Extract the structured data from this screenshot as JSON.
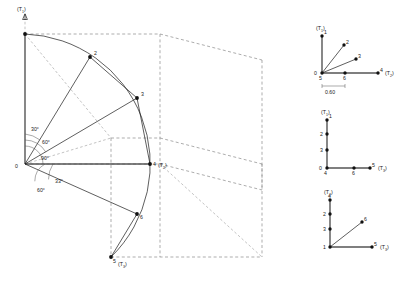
{
  "figure": {
    "main": {
      "name": "main-spherical-diagram",
      "vertical_axis_label": "(T",
      "vertical_axis_sub": "1",
      "vertical_axis_close": ")",
      "origin_label": "0",
      "angles": [
        {
          "id": "a30",
          "text": "30°"
        },
        {
          "id": "a60",
          "text": "60°"
        },
        {
          "id": "a90",
          "text": "90°"
        },
        {
          "id": "a33",
          "text": "33°"
        },
        {
          "id": "a60b",
          "text": "60°"
        }
      ],
      "points": [
        {
          "id": "p1",
          "label": "1"
        },
        {
          "id": "p2",
          "label": "2"
        },
        {
          "id": "p3",
          "label": "3"
        },
        {
          "id": "p4",
          "label": "4"
        },
        {
          "id": "p5",
          "label": "5"
        },
        {
          "id": "p6",
          "label": "6"
        }
      ],
      "axis_t2_label": "(T",
      "axis_t2_sub": "2",
      "axis_t2_close": ")",
      "axis_t3_label": "(T",
      "axis_t3_sub": "3",
      "axis_t3_close": ")"
    },
    "inset_top": {
      "name": "inset-t1-t2",
      "vaxis": "(T",
      "vaxis_sub": "1",
      "vaxis_close": ")",
      "haxis": "(T",
      "haxis_sub": "2",
      "haxis_close": ")",
      "origin_label": "0",
      "dimension": "0.60",
      "points": [
        {
          "id": "t1",
          "label": "1"
        },
        {
          "id": "t2",
          "label": "2"
        },
        {
          "id": "t3",
          "label": "3"
        },
        {
          "id": "t4",
          "label": "4"
        },
        {
          "id": "t5",
          "label": "5"
        },
        {
          "id": "t6",
          "label": "6"
        }
      ]
    },
    "inset_mid": {
      "name": "inset-t1-t3",
      "vaxis": "(T",
      "vaxis_sub": "1",
      "vaxis_close": ")",
      "haxis": "(T",
      "haxis_sub": "3",
      "haxis_close": ")",
      "origin_label": "0",
      "points": [
        {
          "id": "m1",
          "label": "1"
        },
        {
          "id": "m2",
          "label": "2"
        },
        {
          "id": "m3",
          "label": "3"
        },
        {
          "id": "m4",
          "label": "4"
        },
        {
          "id": "m5",
          "label": "5"
        },
        {
          "id": "m6",
          "label": "6"
        }
      ]
    },
    "inset_bottom": {
      "name": "inset-t2-t3",
      "vaxis": "(T",
      "vaxis_sub": "2",
      "vaxis_close": ")",
      "haxis": "(T",
      "haxis_sub": "3",
      "haxis_close": ")",
      "points": [
        {
          "id": "b1",
          "label": "1"
        },
        {
          "id": "b2",
          "label": "2"
        },
        {
          "id": "b3",
          "label": "3"
        },
        {
          "id": "b4",
          "label": "4"
        },
        {
          "id": "b5",
          "label": "5"
        },
        {
          "id": "b6",
          "label": "6"
        }
      ]
    }
  }
}
